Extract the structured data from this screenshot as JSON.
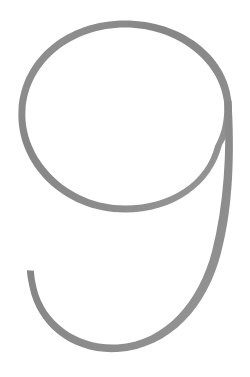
{
  "image": {
    "subject": "9",
    "subject_name": "numeral-nine",
    "style": "thin-stroke outline numeral",
    "alt_text": "Large outlined numeral nine",
    "width": 250,
    "height": 377
  },
  "colors": {
    "background": "#ffffff",
    "stroke": "#8a8a8a",
    "stroke_light": "#9a9a9a",
    "stroke_dark": "#7e7e7e"
  },
  "glyph": {
    "character": "9",
    "bowl": {
      "center_x": 125,
      "center_y": 131,
      "radius_x": 104,
      "radius_y": 108,
      "top_y": 20,
      "bottom_y": 243,
      "left_x": 18,
      "right_x": 232
    },
    "descender": {
      "fork_x": 222,
      "fork_y": 145,
      "bottom_y": 352,
      "tail_tip_x": 27,
      "tail_tip_y": 270
    },
    "stroke_width": {
      "thin": 4.5,
      "thick": 7.5
    },
    "paths": {
      "bowl_outer": "M 222 145 C 231 131 232 115 231 101 C 227 56 182 21 125 21 C 68 21 22 58 19 110 C 16 163 63 212 125 212 C 174 212 212 185 222 145 Z",
      "bowl_inner": "M 215 145 C 223 131 225 115 224 101 C 220 62 178 28 125 28 C 72 28 29 62 26 110 C 23 158 67 205 125 205 C 171 205 206 181 215 145 Z",
      "descender_outer": "M 231 101 C 234 150 233 205 221 252 C 208 305 172 348 118 352 C 74 355 38 327 30 287 C 28 278 27 273 27 270 L 34 271 C 34 275 35 281 37 288 C 45 322 78 346 118 344 C 166 341 199 301 212 251 C 224 204 227 150 224 101 Z"
    }
  }
}
